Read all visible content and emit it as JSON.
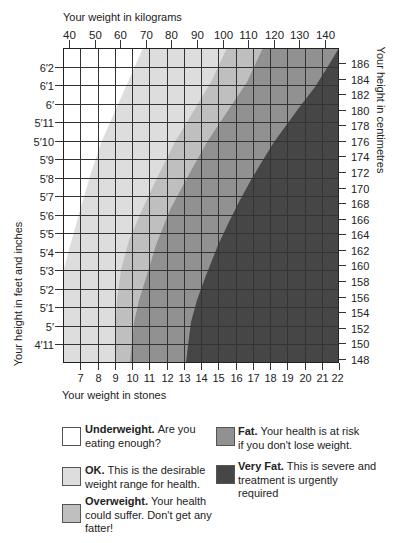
{
  "chart_data": {
    "type": "area",
    "title": "",
    "xlabel": "Your weight in stones",
    "xlabel_top": "Your weight in kilograms",
    "ylabel": "Your height in feet and inches",
    "ylabel_right": "Your height in centimetres",
    "grid": true,
    "legend_position": "bottom",
    "x_axis_bottom": {
      "unit": "stones",
      "min": 6,
      "max": 22,
      "ticks": [
        7,
        8,
        9,
        10,
        11,
        12,
        13,
        14,
        15,
        16,
        17,
        18,
        19,
        20,
        21,
        22
      ]
    },
    "x_axis_top": {
      "unit": "kg",
      "ticks": [
        40,
        50,
        60,
        70,
        80,
        90,
        100,
        110,
        120,
        130,
        140
      ],
      "kg_range": [
        40,
        140
      ],
      "stones_range": [
        6.35,
        21.19
      ]
    },
    "y_axis_left": {
      "unit": "feet and inches",
      "min_in": 58,
      "max_in": 75,
      "ticks": [
        {
          "label": "6′2",
          "inches": 74
        },
        {
          "label": "6′1",
          "inches": 73
        },
        {
          "label": "6′",
          "inches": 72
        },
        {
          "label": "5′11",
          "inches": 71
        },
        {
          "label": "5′10",
          "inches": 70
        },
        {
          "label": "5′9",
          "inches": 69
        },
        {
          "label": "5′8",
          "inches": 68
        },
        {
          "label": "5′7",
          "inches": 67
        },
        {
          "label": "5′6",
          "inches": 66
        },
        {
          "label": "5′5",
          "inches": 65
        },
        {
          "label": "5′4",
          "inches": 64
        },
        {
          "label": "5′3",
          "inches": 63
        },
        {
          "label": "5′2",
          "inches": 62
        },
        {
          "label": "5′1",
          "inches": 61
        },
        {
          "label": "5′",
          "inches": 60
        },
        {
          "label": "4′11",
          "inches": 59
        }
      ]
    },
    "y_axis_right": {
      "unit": "cm",
      "ticks": [
        186,
        184,
        182,
        180,
        178,
        176,
        174,
        172,
        170,
        168,
        166,
        164,
        162,
        160,
        158,
        156,
        154,
        152,
        150,
        148
      ],
      "cm_range": [
        148,
        186
      ],
      "inches_range": [
        58.22,
        74.19
      ]
    },
    "base_band": "OK",
    "bands": [
      {
        "name": "Underweight",
        "color": "#ffffff"
      },
      {
        "name": "OK",
        "color": "#dddddd"
      },
      {
        "name": "Overweight",
        "color": "#bfbfbf"
      },
      {
        "name": "Fat",
        "color": "#919191"
      },
      {
        "name": "Very Fat",
        "color": "#464646"
      }
    ],
    "boundaries": [
      {
        "between": [
          "Underweight",
          "OK"
        ],
        "fill_band": "Underweight",
        "fill_side": "left",
        "points": [
          [
            10.64,
            75.0
          ],
          [
            9.77,
            73.17
          ],
          [
            8.99,
            71.55
          ],
          [
            8.23,
            69.93
          ],
          [
            7.59,
            68.15
          ],
          [
            6.99,
            66.26
          ],
          [
            6.43,
            64.37
          ],
          [
            6.0,
            62.91
          ]
        ]
      },
      {
        "between": [
          "OK",
          "Overweight"
        ],
        "fill_band": "Overweight",
        "fill_side": "right",
        "points": [
          [
            15.51,
            75.0
          ],
          [
            14.58,
            73.17
          ],
          [
            13.54,
            71.55
          ],
          [
            12.49,
            69.93
          ],
          [
            11.45,
            67.98
          ],
          [
            10.58,
            66.26
          ],
          [
            9.83,
            64.64
          ],
          [
            9.36,
            63.02
          ],
          [
            9.13,
            61.4
          ],
          [
            9.04,
            59.78
          ],
          [
            9.01,
            58.0
          ]
        ]
      },
      {
        "between": [
          "Overweight",
          "Fat"
        ],
        "fill_band": "Fat",
        "fill_side": "right",
        "points": [
          [
            17.59,
            75.0
          ],
          [
            16.67,
            73.17
          ],
          [
            15.51,
            71.55
          ],
          [
            14.35,
            69.93
          ],
          [
            13.19,
            67.98
          ],
          [
            12.2,
            66.26
          ],
          [
            11.39,
            64.37
          ],
          [
            10.81,
            62.59
          ],
          [
            10.41,
            61.4
          ],
          [
            10.12,
            60.21
          ],
          [
            9.88,
            58.0
          ]
        ]
      },
      {
        "between": [
          "Fat",
          "Very Fat"
        ],
        "fill_band": "Very Fat",
        "fill_side": "right",
        "points": [
          [
            22.0,
            75.0
          ],
          [
            21.3,
            73.92
          ],
          [
            20.61,
            72.9
          ],
          [
            19.8,
            71.92
          ],
          [
            19.04,
            70.95
          ],
          [
            18.23,
            69.93
          ],
          [
            17.59,
            68.96
          ],
          [
            16.96,
            67.98
          ],
          [
            16.26,
            66.8
          ],
          [
            15.62,
            65.61
          ],
          [
            14.99,
            64.37
          ],
          [
            14.23,
            62.59
          ],
          [
            13.77,
            61.4
          ],
          [
            13.42,
            60.21
          ],
          [
            13.25,
            58.97
          ],
          [
            13.13,
            58.0
          ]
        ]
      }
    ]
  },
  "legend": {
    "items": [
      {
        "label": "Underweight.",
        "lines": [
          "Are you",
          "eating enough?"
        ]
      },
      {
        "label": "OK.",
        "lines": [
          "This is the desirable",
          "weight range for health."
        ]
      },
      {
        "label": "Overweight.",
        "lines": [
          "Your health",
          "could suffer. Don't get any",
          "fatter!"
        ]
      },
      {
        "label": "Fat.",
        "lines": [
          "Your health is at risk",
          "if you don't lose weight."
        ]
      },
      {
        "label": "Very Fat.",
        "lines": [
          "This is severe and",
          "treatment is urgently",
          "required"
        ]
      }
    ]
  }
}
